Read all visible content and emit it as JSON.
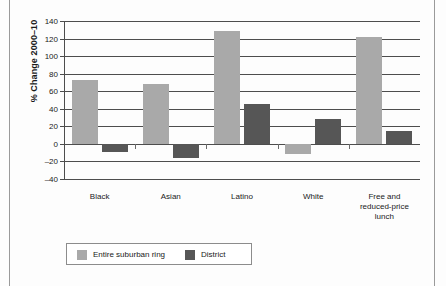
{
  "chart_data": {
    "type": "bar",
    "title": "",
    "xlabel": "",
    "ylabel": "% Change 2000–10",
    "ylim": [
      -40,
      140
    ],
    "yticks": [
      140,
      120,
      100,
      80,
      60,
      40,
      20,
      0,
      -20,
      -40
    ],
    "ytick_labels": [
      "140",
      "120",
      "100",
      "80",
      "60",
      "40",
      "20",
      "0",
      "–20",
      "–40"
    ],
    "grid": true,
    "legend_position": "bottom-left",
    "categories": [
      "Black",
      "Asian",
      "Latino",
      "White",
      "Free and\nreduced-price\nlunch"
    ],
    "category_lines": [
      [
        "Black"
      ],
      [
        "Asian"
      ],
      [
        "Latino"
      ],
      [
        "White"
      ],
      [
        "Free and",
        "reduced-price",
        "lunch"
      ]
    ],
    "series": [
      {
        "name": "Entire suburban ring",
        "color": "#a9a9a9",
        "values": [
          73,
          68,
          129,
          -12,
          122
        ]
      },
      {
        "name": "District",
        "color": "#565656",
        "values": [
          -9,
          -16,
          46,
          28,
          15
        ]
      }
    ]
  },
  "legend": {
    "items": [
      {
        "label": "Entire suburban ring",
        "swatch": "light"
      },
      {
        "label": "District",
        "swatch": "dark"
      }
    ]
  }
}
